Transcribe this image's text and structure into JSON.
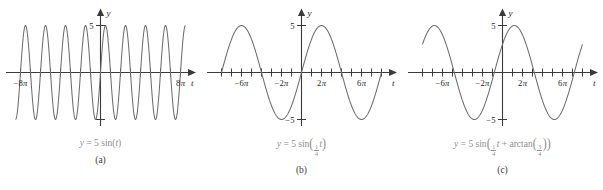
{
  "figure": {
    "axis_labels": {
      "x": "t",
      "y": "y"
    },
    "curve_color": "#6d6d6d",
    "axis_color": "#3a3a3a",
    "caption_color": "#8e8e90"
  },
  "panels": [
    {
      "letter": "(a)",
      "formula_plain": "y = 5 sin(t)",
      "formula": {
        "lhs": "y",
        "eq": "=",
        "amplitude": "5",
        "func": "sin",
        "open": "(",
        "arg": "t",
        "close": ")"
      },
      "x_tick_labels": [
        {
          "value": -25.1327,
          "text": "−8π"
        },
        {
          "value": 25.1327,
          "text": "8π"
        }
      ],
      "y_tick_labels": [
        {
          "value": 5,
          "text": "5"
        }
      ],
      "chart": {
        "type": "line",
        "title": "y = 5 sin(t)",
        "xlabel": "t",
        "ylabel": "y",
        "amplitude": 5,
        "frequency": 1,
        "phase": 0,
        "xlim": [
          -27.5,
          27.5
        ],
        "ylim": [
          -6.6,
          6.6
        ],
        "x_ticks": [
          -25.1327,
          -21.9911,
          -18.8496,
          -15.708,
          -12.5664,
          -9.4248,
          -6.2832,
          -3.1416,
          3.1416,
          6.2832,
          9.4248,
          12.5664,
          15.708,
          18.8496,
          21.9911,
          25.1327
        ],
        "y_ticks": [
          5,
          -5
        ],
        "x_domain": [
          -26.7,
          26.7
        ],
        "grid": false
      }
    },
    {
      "letter": "(b)",
      "formula_plain": "y = 5 sin((1/4)t)",
      "formula": {
        "lhs": "y",
        "eq": "=",
        "amplitude": "5",
        "func": "sin",
        "open": "(",
        "frac_num": "1",
        "frac_den": "4",
        "arg": "t",
        "close": ")"
      },
      "x_tick_labels": [
        {
          "value": -18.8496,
          "text": "−6π"
        },
        {
          "value": -6.2832,
          "text": "−2π"
        },
        {
          "value": 6.2832,
          "text": "2π"
        },
        {
          "value": 18.8496,
          "text": "6π"
        }
      ],
      "y_tick_labels": [
        {
          "value": 5,
          "text": "5"
        },
        {
          "value": -5,
          "text": "−5"
        }
      ],
      "chart": {
        "type": "line",
        "title": "y = 5 sin(t/4)",
        "xlabel": "t",
        "ylabel": "y",
        "amplitude": 5,
        "frequency": 0.25,
        "phase": 0,
        "xlim": [
          -27.5,
          27.5
        ],
        "ylim": [
          -6.6,
          6.6
        ],
        "x_ticks": [
          -25.1327,
          -21.9911,
          -18.8496,
          -15.708,
          -12.5664,
          -9.4248,
          -6.2832,
          -3.1416,
          3.1416,
          6.2832,
          9.4248,
          12.5664,
          15.708,
          18.8496,
          21.9911,
          25.1327
        ],
        "y_ticks": [
          5,
          -5
        ],
        "x_domain": [
          -25.1327,
          25.1327
        ],
        "grid": false
      }
    },
    {
      "letter": "(c)",
      "formula_plain": "y = 5 sin((1/4)t + arctan(3/4))",
      "formula": {
        "lhs": "y",
        "eq": "=",
        "amplitude": "5",
        "func": "sin",
        "open": "(",
        "frac_num": "1",
        "frac_den": "4",
        "arg": "t",
        "plus": "+",
        "func2": "arctan",
        "frac2_num": "3",
        "frac2_den": "4",
        "close": ")"
      },
      "x_tick_labels": [
        {
          "value": -18.8496,
          "text": "−6π"
        },
        {
          "value": -6.2832,
          "text": "−2π"
        },
        {
          "value": 6.2832,
          "text": "2π"
        },
        {
          "value": 18.8496,
          "text": "6π"
        }
      ],
      "y_tick_labels": [
        {
          "value": 5,
          "text": "5"
        },
        {
          "value": -5,
          "text": "−5"
        }
      ],
      "chart": {
        "type": "line",
        "title": "y = 5 sin(t/4 + arctan(3/4))",
        "xlabel": "t",
        "ylabel": "y",
        "amplitude": 5,
        "frequency": 0.25,
        "phase": 0.6435,
        "xlim": [
          -27.5,
          27.5
        ],
        "ylim": [
          -6.6,
          6.6
        ],
        "x_ticks": [
          -25.1327,
          -21.9911,
          -18.8496,
          -15.708,
          -12.5664,
          -9.4248,
          -6.2832,
          -3.1416,
          3.1416,
          6.2832,
          9.4248,
          12.5664,
          15.708,
          18.8496,
          21.9911,
          25.1327
        ],
        "y_ticks": [
          5,
          -5
        ],
        "x_domain": [
          -25.1327,
          25.1327
        ],
        "grid": false
      }
    }
  ]
}
